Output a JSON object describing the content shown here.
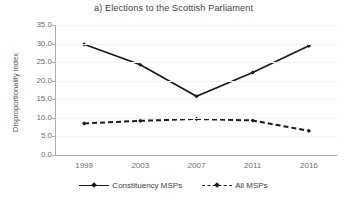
{
  "chart_data": {
    "type": "line",
    "title": "a) Elections to the Scottish Parliament",
    "xlabel": "",
    "ylabel": "Disproportionality index",
    "categories": [
      "1999",
      "2003",
      "2007",
      "2011",
      "2016"
    ],
    "ylim": [
      0.0,
      35.0
    ],
    "ytick_labels": [
      "35.0",
      "30.0",
      "25.0",
      "20.0",
      "15.0",
      "10.0",
      "5.0",
      "0.0"
    ],
    "ytick_values": [
      35.0,
      30.0,
      25.0,
      20.0,
      15.0,
      10.0,
      5.0,
      0.0
    ],
    "grid": true,
    "legend_position": "bottom",
    "series": [
      {
        "name": "Constituency MSPs",
        "style": "solid",
        "color": "#1a1a1a",
        "marker": "diamond",
        "values": [
          29.8,
          24.3,
          15.8,
          22.2,
          29.4
        ]
      },
      {
        "name": "All MSPs",
        "style": "dashed",
        "color": "#1a1a1a",
        "marker": "diamond",
        "values": [
          8.5,
          9.2,
          9.7,
          9.3,
          6.5
        ]
      }
    ]
  },
  "legend": {
    "items": [
      {
        "label": "Constituency MSPs"
      },
      {
        "label": "All MSPs"
      }
    ]
  }
}
